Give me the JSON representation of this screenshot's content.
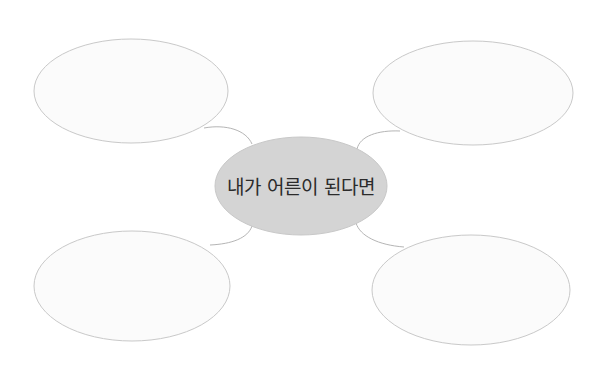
{
  "diagram": {
    "type": "mind-map",
    "central_topic": {
      "label": "내가 어른이 된다면",
      "fill": "#d4d4d4",
      "stroke": "#c8c8c8"
    },
    "branches": [
      {
        "position": "top-left",
        "label": "",
        "fill": "#fbfbfb",
        "stroke": "#c9c9c9"
      },
      {
        "position": "top-right",
        "label": "",
        "fill": "#fbfbfb",
        "stroke": "#c9c9c9"
      },
      {
        "position": "bottom-left",
        "label": "",
        "fill": "#fbfbfb",
        "stroke": "#c9c9c9"
      },
      {
        "position": "bottom-right",
        "label": "",
        "fill": "#fbfbfb",
        "stroke": "#c9c9c9"
      }
    ],
    "connector_color": "#b5b5b5",
    "background": "#ffffff"
  }
}
